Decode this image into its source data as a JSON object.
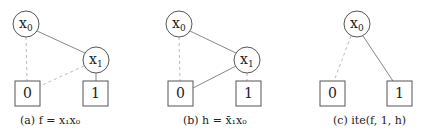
{
  "figures": [
    {
      "id": "a",
      "caption": "(a) f = x₁x₀",
      "nodes": [
        {
          "label": "x",
          "sub": "0",
          "type": "decision"
        },
        {
          "label": "x",
          "sub": "1",
          "type": "decision"
        },
        {
          "label": "0",
          "type": "terminal"
        },
        {
          "label": "1",
          "type": "terminal"
        }
      ],
      "edges": [
        {
          "from": "x0",
          "to": "0",
          "style": "dashed"
        },
        {
          "from": "x0",
          "to": "x1",
          "style": "solid"
        },
        {
          "from": "x1",
          "to": "0",
          "style": "dashed"
        },
        {
          "from": "x1",
          "to": "1",
          "style": "solid"
        }
      ]
    },
    {
      "id": "b",
      "caption": "(b) h = x̄₁x₀",
      "nodes": [
        {
          "label": "x",
          "sub": "0",
          "type": "decision"
        },
        {
          "label": "x",
          "sub": "1",
          "type": "decision"
        },
        {
          "label": "0",
          "type": "terminal"
        },
        {
          "label": "1",
          "type": "terminal"
        }
      ],
      "edges": [
        {
          "from": "x0",
          "to": "0",
          "style": "dashed"
        },
        {
          "from": "x0",
          "to": "x1",
          "style": "solid"
        },
        {
          "from": "x1",
          "to": "0",
          "style": "solid"
        },
        {
          "from": "x1",
          "to": "1",
          "style": "dashed"
        }
      ]
    },
    {
      "id": "c",
      "caption": "(c) ite(f, 1, h)",
      "nodes": [
        {
          "label": "x",
          "sub": "0",
          "type": "decision"
        },
        {
          "label": "0",
          "type": "terminal"
        },
        {
          "label": "1",
          "type": "terminal"
        }
      ],
      "edges": [
        {
          "from": "x0",
          "to": "0",
          "style": "dashed"
        },
        {
          "from": "x0",
          "to": "1",
          "style": "solid"
        }
      ]
    }
  ],
  "colors": {
    "line": "#888888",
    "dashed": "#bbbbbb",
    "stroke": "#555555"
  }
}
